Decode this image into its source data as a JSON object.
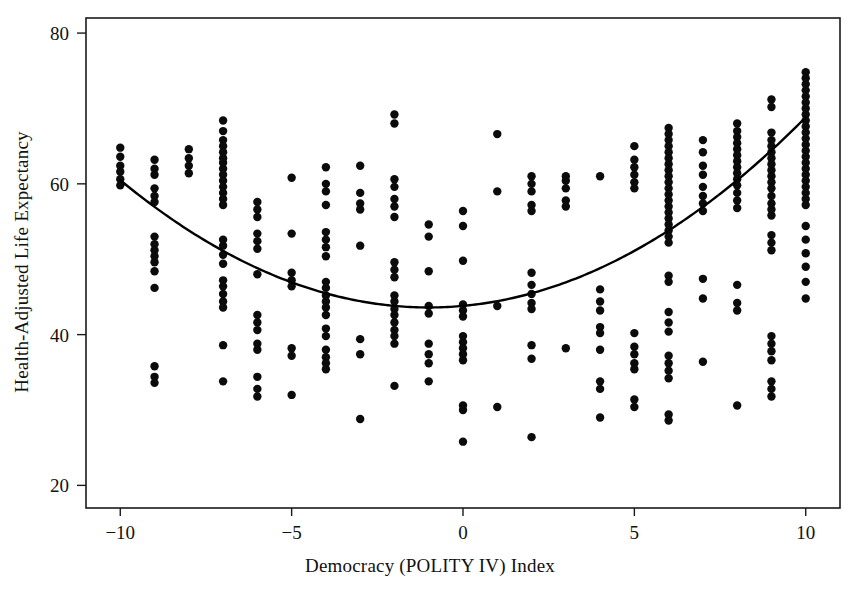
{
  "chart_data": {
    "type": "scatter",
    "title": "",
    "xlabel": "Democracy (POLITY IV) Index",
    "ylabel": "Health-Adjusted Life Expectancy",
    "xlim": [
      -11,
      11
    ],
    "ylim": [
      17,
      82
    ],
    "xticks": [
      -10,
      -5,
      0,
      5,
      10
    ],
    "xtick_labels": [
      "−10",
      "−5",
      "0",
      "5",
      "10"
    ],
    "yticks": [
      20,
      40,
      60,
      80
    ],
    "ytick_labels": [
      "20",
      "40",
      "60",
      "80"
    ],
    "grid": false,
    "legend": "none",
    "point_color": "#0b0b0b",
    "curve_color": "#000000",
    "frame_color": "#1a1a1a",
    "marker_radius_px": 4.2,
    "fit": {
      "kind": "quadratic",
      "description": "U-shaped quadratic fit, minimum near x = -1",
      "vertex_x": -1.0,
      "vertex_y": 43.6,
      "endpoint_left": [
        -10,
        61.4
      ],
      "endpoint_right": [
        10,
        65.2
      ],
      "coefficients": {
        "a": 0.2085,
        "b": 0.417,
        "c": 43.81
      }
    },
    "series": [
      {
        "name": "Countries",
        "points": [
          [
            -10,
            64.8
          ],
          [
            -10,
            63.6
          ],
          [
            -10,
            62.4
          ],
          [
            -10,
            61.6
          ],
          [
            -10,
            60.6
          ],
          [
            -10,
            59.8
          ],
          [
            -9,
            63.2
          ],
          [
            -9,
            62.0
          ],
          [
            -9,
            61.2
          ],
          [
            -9,
            59.4
          ],
          [
            -9,
            58.4
          ],
          [
            -9,
            57.6
          ],
          [
            -9,
            53.0
          ],
          [
            -9,
            52.0
          ],
          [
            -9,
            51.2
          ],
          [
            -9,
            50.4
          ],
          [
            -9,
            49.6
          ],
          [
            -9,
            48.4
          ],
          [
            -9,
            46.2
          ],
          [
            -9,
            35.8
          ],
          [
            -9,
            34.4
          ],
          [
            -9,
            33.6
          ],
          [
            -8,
            64.6
          ],
          [
            -8,
            63.4
          ],
          [
            -8,
            62.4
          ],
          [
            -8,
            61.4
          ],
          [
            -7,
            68.4
          ],
          [
            -7,
            67.0
          ],
          [
            -7,
            65.8
          ],
          [
            -7,
            65.0
          ],
          [
            -7,
            64.2
          ],
          [
            -7,
            63.4
          ],
          [
            -7,
            62.8
          ],
          [
            -7,
            62.0
          ],
          [
            -7,
            61.2
          ],
          [
            -7,
            60.4
          ],
          [
            -7,
            59.6
          ],
          [
            -7,
            58.8
          ],
          [
            -7,
            58.0
          ],
          [
            -7,
            57.2
          ],
          [
            -7,
            52.6
          ],
          [
            -7,
            51.8
          ],
          [
            -7,
            50.6
          ],
          [
            -7,
            49.4
          ],
          [
            -7,
            47.2
          ],
          [
            -7,
            46.4
          ],
          [
            -7,
            45.4
          ],
          [
            -7,
            44.4
          ],
          [
            -7,
            43.6
          ],
          [
            -7,
            38.6
          ],
          [
            -7,
            33.8
          ],
          [
            -6,
            57.6
          ],
          [
            -6,
            56.6
          ],
          [
            -6,
            55.6
          ],
          [
            -6,
            53.4
          ],
          [
            -6,
            52.4
          ],
          [
            -6,
            51.4
          ],
          [
            -6,
            48.0
          ],
          [
            -6,
            42.6
          ],
          [
            -6,
            41.6
          ],
          [
            -6,
            40.6
          ],
          [
            -6,
            38.8
          ],
          [
            -6,
            38.0
          ],
          [
            -6,
            34.4
          ],
          [
            -6,
            32.8
          ],
          [
            -6,
            31.8
          ],
          [
            -5,
            60.8
          ],
          [
            -5,
            53.4
          ],
          [
            -5,
            48.2
          ],
          [
            -5,
            47.2
          ],
          [
            -5,
            46.4
          ],
          [
            -5,
            38.2
          ],
          [
            -5,
            37.2
          ],
          [
            -5,
            32.0
          ],
          [
            -4,
            62.2
          ],
          [
            -4,
            60.0
          ],
          [
            -4,
            59.0
          ],
          [
            -4,
            57.2
          ],
          [
            -4,
            53.6
          ],
          [
            -4,
            52.6
          ],
          [
            -4,
            51.6
          ],
          [
            -4,
            50.4
          ],
          [
            -4,
            47.0
          ],
          [
            -4,
            46.2
          ],
          [
            -4,
            45.2
          ],
          [
            -4,
            44.4
          ],
          [
            -4,
            43.6
          ],
          [
            -4,
            42.6
          ],
          [
            -4,
            40.8
          ],
          [
            -4,
            39.8
          ],
          [
            -4,
            38.0
          ],
          [
            -4,
            37.0
          ],
          [
            -4,
            36.2
          ],
          [
            -4,
            35.4
          ],
          [
            -3,
            62.4
          ],
          [
            -3,
            58.8
          ],
          [
            -3,
            57.4
          ],
          [
            -3,
            56.6
          ],
          [
            -3,
            51.8
          ],
          [
            -3,
            39.4
          ],
          [
            -3,
            37.4
          ],
          [
            -3,
            28.8
          ],
          [
            -2,
            69.2
          ],
          [
            -2,
            68.0
          ],
          [
            -2,
            60.6
          ],
          [
            -2,
            59.6
          ],
          [
            -2,
            58.0
          ],
          [
            -2,
            57.0
          ],
          [
            -2,
            55.6
          ],
          [
            -2,
            49.6
          ],
          [
            -2,
            48.6
          ],
          [
            -2,
            47.6
          ],
          [
            -2,
            45.2
          ],
          [
            -2,
            44.4
          ],
          [
            -2,
            43.4
          ],
          [
            -2,
            42.6
          ],
          [
            -2,
            41.6
          ],
          [
            -2,
            40.6
          ],
          [
            -2,
            39.8
          ],
          [
            -2,
            38.8
          ],
          [
            -2,
            33.2
          ],
          [
            -1,
            54.6
          ],
          [
            -1,
            53.0
          ],
          [
            -1,
            48.4
          ],
          [
            -1,
            43.8
          ],
          [
            -1,
            42.8
          ],
          [
            -1,
            38.8
          ],
          [
            -1,
            37.4
          ],
          [
            -1,
            36.2
          ],
          [
            -1,
            33.8
          ],
          [
            0,
            56.4
          ],
          [
            0,
            54.4
          ],
          [
            0,
            49.8
          ],
          [
            0,
            44.0
          ],
          [
            0,
            43.2
          ],
          [
            0,
            42.4
          ],
          [
            0,
            39.8
          ],
          [
            0,
            39.0
          ],
          [
            0,
            38.2
          ],
          [
            0,
            37.4
          ],
          [
            0,
            36.6
          ],
          [
            0,
            30.6
          ],
          [
            0,
            30.0
          ],
          [
            0,
            25.8
          ],
          [
            1,
            66.6
          ],
          [
            1,
            59.0
          ],
          [
            1,
            43.8
          ],
          [
            1,
            30.4
          ],
          [
            2,
            61.0
          ],
          [
            2,
            60.0
          ],
          [
            2,
            59.0
          ],
          [
            2,
            57.2
          ],
          [
            2,
            56.4
          ],
          [
            2,
            48.2
          ],
          [
            2,
            46.6
          ],
          [
            2,
            45.4
          ],
          [
            2,
            44.2
          ],
          [
            2,
            43.4
          ],
          [
            2,
            38.6
          ],
          [
            2,
            36.8
          ],
          [
            2,
            26.4
          ],
          [
            3,
            61.0
          ],
          [
            3,
            60.4
          ],
          [
            3,
            59.4
          ],
          [
            3,
            57.8
          ],
          [
            3,
            57.0
          ],
          [
            3,
            38.2
          ],
          [
            4,
            61.0
          ],
          [
            4,
            46.0
          ],
          [
            4,
            44.4
          ],
          [
            4,
            43.2
          ],
          [
            4,
            41.0
          ],
          [
            4,
            40.2
          ],
          [
            4,
            38.0
          ],
          [
            4,
            33.8
          ],
          [
            4,
            32.8
          ],
          [
            4,
            29.0
          ],
          [
            5,
            65.0
          ],
          [
            5,
            63.2
          ],
          [
            5,
            62.2
          ],
          [
            5,
            61.2
          ],
          [
            5,
            60.2
          ],
          [
            5,
            59.4
          ],
          [
            5,
            40.2
          ],
          [
            5,
            38.4
          ],
          [
            5,
            37.4
          ],
          [
            5,
            36.2
          ],
          [
            5,
            35.4
          ],
          [
            5,
            31.4
          ],
          [
            5,
            30.4
          ],
          [
            6,
            67.4
          ],
          [
            6,
            66.6
          ],
          [
            6,
            65.8
          ],
          [
            6,
            65.0
          ],
          [
            6,
            64.2
          ],
          [
            6,
            63.4
          ],
          [
            6,
            62.6
          ],
          [
            6,
            61.8
          ],
          [
            6,
            61.0
          ],
          [
            6,
            60.2
          ],
          [
            6,
            59.4
          ],
          [
            6,
            58.6
          ],
          [
            6,
            57.8
          ],
          [
            6,
            57.0
          ],
          [
            6,
            56.2
          ],
          [
            6,
            55.4
          ],
          [
            6,
            54.6
          ],
          [
            6,
            53.8
          ],
          [
            6,
            53.0
          ],
          [
            6,
            52.2
          ],
          [
            6,
            47.8
          ],
          [
            6,
            47.0
          ],
          [
            6,
            43.0
          ],
          [
            6,
            41.6
          ],
          [
            6,
            40.4
          ],
          [
            6,
            37.2
          ],
          [
            6,
            36.2
          ],
          [
            6,
            35.2
          ],
          [
            6,
            34.2
          ],
          [
            6,
            29.4
          ],
          [
            6,
            28.6
          ],
          [
            7,
            65.8
          ],
          [
            7,
            64.2
          ],
          [
            7,
            62.4
          ],
          [
            7,
            61.2
          ],
          [
            7,
            59.6
          ],
          [
            7,
            58.4
          ],
          [
            7,
            57.4
          ],
          [
            7,
            56.4
          ],
          [
            7,
            47.4
          ],
          [
            7,
            44.8
          ],
          [
            7,
            36.4
          ],
          [
            8,
            68.0
          ],
          [
            8,
            67.0
          ],
          [
            8,
            66.2
          ],
          [
            8,
            65.4
          ],
          [
            8,
            64.6
          ],
          [
            8,
            63.8
          ],
          [
            8,
            63.0
          ],
          [
            8,
            62.2
          ],
          [
            8,
            61.4
          ],
          [
            8,
            60.6
          ],
          [
            8,
            59.8
          ],
          [
            8,
            58.8
          ],
          [
            8,
            57.8
          ],
          [
            8,
            56.8
          ],
          [
            8,
            46.6
          ],
          [
            8,
            44.2
          ],
          [
            8,
            43.2
          ],
          [
            8,
            30.6
          ],
          [
            9,
            71.2
          ],
          [
            9,
            70.2
          ],
          [
            9,
            66.8
          ],
          [
            9,
            65.8
          ],
          [
            9,
            65.0
          ],
          [
            9,
            64.2
          ],
          [
            9,
            63.4
          ],
          [
            9,
            62.6
          ],
          [
            9,
            61.8
          ],
          [
            9,
            61.0
          ],
          [
            9,
            60.2
          ],
          [
            9,
            59.4
          ],
          [
            9,
            58.4
          ],
          [
            9,
            57.4
          ],
          [
            9,
            56.6
          ],
          [
            9,
            55.8
          ],
          [
            9,
            53.2
          ],
          [
            9,
            52.2
          ],
          [
            9,
            51.2
          ],
          [
            9,
            39.8
          ],
          [
            9,
            38.8
          ],
          [
            9,
            37.8
          ],
          [
            9,
            36.6
          ],
          [
            9,
            33.8
          ],
          [
            9,
            32.8
          ],
          [
            9,
            31.8
          ],
          [
            10,
            74.8
          ],
          [
            10,
            74.0
          ],
          [
            10,
            73.2
          ],
          [
            10,
            72.4
          ],
          [
            10,
            71.6
          ],
          [
            10,
            70.8
          ],
          [
            10,
            70.0
          ],
          [
            10,
            69.2
          ],
          [
            10,
            68.4
          ],
          [
            10,
            67.6
          ],
          [
            10,
            66.8
          ],
          [
            10,
            66.0
          ],
          [
            10,
            65.2
          ],
          [
            10,
            64.4
          ],
          [
            10,
            63.6
          ],
          [
            10,
            62.8
          ],
          [
            10,
            62.0
          ],
          [
            10,
            61.2
          ],
          [
            10,
            60.4
          ],
          [
            10,
            59.6
          ],
          [
            10,
            58.8
          ],
          [
            10,
            58.0
          ],
          [
            10,
            57.2
          ],
          [
            10,
            54.4
          ],
          [
            10,
            52.6
          ],
          [
            10,
            50.8
          ],
          [
            10,
            49.0
          ],
          [
            10,
            47.0
          ],
          [
            10,
            44.8
          ]
        ]
      }
    ]
  }
}
